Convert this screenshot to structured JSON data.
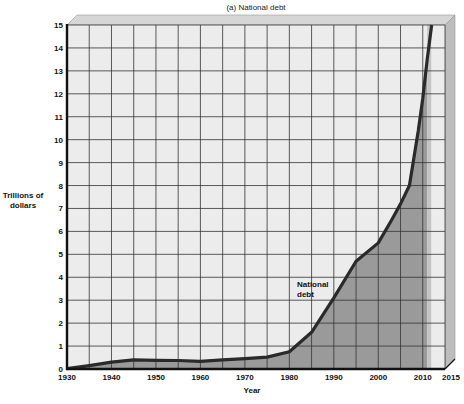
{
  "chart_data": {
    "type": "area",
    "title": "(a) National debt",
    "xlabel": "Year",
    "ylabel": "Trillions of dollars",
    "ylabel_lines": [
      "Trillions of",
      "dollars"
    ],
    "xlim": [
      1930,
      2015
    ],
    "ylim": [
      0,
      15
    ],
    "xticks": [
      1930,
      1940,
      1950,
      1960,
      1970,
      1980,
      1990,
      2000,
      2010,
      2015
    ],
    "yticks": [
      0,
      1,
      2,
      3,
      4,
      5,
      6,
      7,
      8,
      9,
      10,
      11,
      12,
      13,
      14,
      15
    ],
    "grid": true,
    "grid_x_step": 5,
    "grid_y_step": 1,
    "legend": null,
    "annotations": [
      {
        "text_lines": [
          "National",
          "debt"
        ],
        "x": 1984,
        "y": 3.5
      }
    ],
    "series": [
      {
        "name": "National debt",
        "x": [
          1930,
          1935,
          1940,
          1945,
          1950,
          1955,
          1960,
          1965,
          1970,
          1975,
          1980,
          1985,
          1990,
          1995,
          2000,
          2003,
          2005,
          2007,
          2008,
          2009,
          2010,
          2011,
          2012
        ],
        "values": [
          0.02,
          0.15,
          0.3,
          0.4,
          0.38,
          0.37,
          0.33,
          0.4,
          0.45,
          0.52,
          0.75,
          1.6,
          3.1,
          4.7,
          5.5,
          6.5,
          7.2,
          8.0,
          9.2,
          10.4,
          11.8,
          13.5,
          15.0
        ]
      }
    ],
    "shaded_region_end_year": 2011
  },
  "colors": {
    "grid_background": "#ececec",
    "frame": "#d6d6d6",
    "frame_dark": "#bdbdbd",
    "area_fill": "#9a9a9a",
    "line": "#2a2a2a",
    "grid_line": "#333333"
  }
}
